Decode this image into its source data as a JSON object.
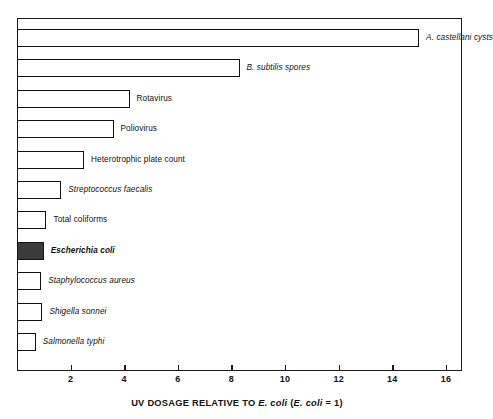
{
  "chart_data": {
    "type": "bar",
    "orientation": "horizontal",
    "title": "",
    "xlabel": "UV DOSAGE RELATIVE TO E. coli (E. coli = 1)",
    "ylabel": "",
    "xlim": [
      0,
      16.6
    ],
    "xticks": [
      2,
      4,
      6,
      8,
      10,
      12,
      14,
      16
    ],
    "xtick_labels": [
      "2",
      "4",
      "6",
      "8",
      "10",
      "12",
      "14",
      "16"
    ],
    "grid": false,
    "legend": null,
    "categories": [
      "A. castellani cysts",
      "B. subtilis spores",
      "Rotavirus",
      "Poliovirus",
      "Heterotrophic plate count",
      "Streptococcus faecalis",
      "Total coliforms",
      "Escherichia coli",
      "Staphylococcus aureus",
      "Shigella sonnei",
      "Salmonella typhi"
    ],
    "values": [
      15.0,
      8.3,
      4.2,
      3.6,
      2.5,
      1.65,
      1.1,
      1.0,
      0.9,
      0.95,
      0.7
    ],
    "bars": [
      {
        "label": "A. castellani cysts",
        "value": 15.0,
        "style": "italic",
        "fill": "#ffffff",
        "highlight": false
      },
      {
        "label": "B. subtilis spores",
        "value": 8.3,
        "style": "italic",
        "fill": "#ffffff",
        "highlight": false
      },
      {
        "label": "Rotavirus",
        "value": 4.2,
        "style": "roman",
        "fill": "#ffffff",
        "highlight": false
      },
      {
        "label": "Poliovirus",
        "value": 3.6,
        "style": "roman",
        "fill": "#ffffff",
        "highlight": false
      },
      {
        "label": "Heterotrophic plate count",
        "value": 2.5,
        "style": "roman",
        "fill": "#ffffff",
        "highlight": false
      },
      {
        "label": "Streptococcus faecalis",
        "value": 1.65,
        "style": "italic",
        "fill": "#ffffff",
        "highlight": false
      },
      {
        "label": "Total coliforms",
        "value": 1.1,
        "style": "roman",
        "fill": "#ffffff",
        "highlight": false
      },
      {
        "label": "Escherichia coli",
        "value": 1.0,
        "style": "bold-italic",
        "fill": "#3b3b3b",
        "highlight": true
      },
      {
        "label": "Staphylococcus aureus",
        "value": 0.9,
        "style": "italic",
        "fill": "#ffffff",
        "highlight": false
      },
      {
        "label": "Shigella sonnei",
        "value": 0.95,
        "style": "italic",
        "fill": "#ffffff",
        "highlight": false
      },
      {
        "label": "Salmonella typhi",
        "value": 0.7,
        "style": "italic",
        "fill": "#ffffff",
        "highlight": false
      }
    ],
    "colors": {
      "bar_outline": "#111111",
      "bar_fill": "#ffffff",
      "highlight_fill": "#3b3b3b",
      "frame": "#1b1b1b",
      "text": "#111111"
    }
  },
  "axis_title_parts": {
    "lead": "UV DOSAGE RELATIVE TO ",
    "species1": "E. coli",
    "mid": " (",
    "species2": "E. coli",
    "tail": " = 1)"
  }
}
